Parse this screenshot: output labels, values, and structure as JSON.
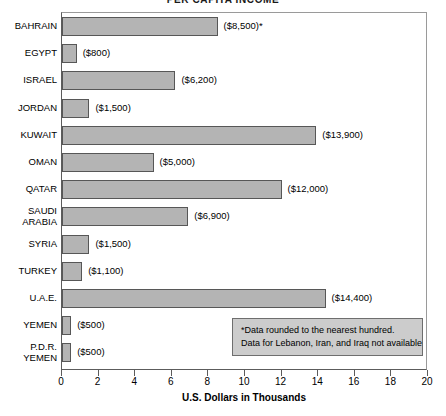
{
  "chart_data": {
    "type": "bar",
    "orientation": "horizontal",
    "title": "PER CAPITA INCOME",
    "xlabel": "U.S. Dollars in Thousands",
    "ylabel": "",
    "xlim": [
      0,
      20
    ],
    "xticks": [
      0,
      2,
      4,
      6,
      8,
      10,
      12,
      14,
      16,
      18,
      20
    ],
    "grid": false,
    "legend": "none",
    "units": "thousands of U.S. dollars",
    "bar_color": "#b4b4b4",
    "bar_border_color": "#575757",
    "categories": [
      "BAHRAIN",
      "EGYPT",
      "ISRAEL",
      "JORDAN",
      "KUWAIT",
      "OMAN",
      "QATAR",
      "SAUDI\nARABIA",
      "SYRIA",
      "TURKEY",
      "U.A.E.",
      "YEMEN",
      "P.D.R.\nYEMEN"
    ],
    "values": [
      8.5,
      0.8,
      6.2,
      1.5,
      13.9,
      5.0,
      12.0,
      6.9,
      1.5,
      1.1,
      14.4,
      0.5,
      0.5
    ],
    "data_labels": [
      "($8,500)*",
      "($800)",
      "($6,200)",
      "($1,500)",
      "($13,900)",
      "($5,000)",
      "($12,000)",
      "($6,900)",
      "($1,500)",
      "($1,100)",
      "($14,400)",
      "($500)",
      "($500)"
    ],
    "annotations": [
      "*Data rounded to the nearest hundred.",
      "Data for Lebanon, Iran, and Iraq not available"
    ]
  }
}
